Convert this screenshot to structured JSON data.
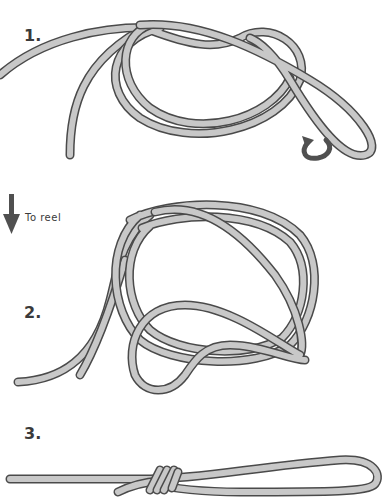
{
  "steps": [
    {
      "number": "1.",
      "label_top": 28
    },
    {
      "number": "2.",
      "label_top": 305
    },
    {
      "number": "3.",
      "label_top": 425
    }
  ],
  "annotations": {
    "reel_label": "To reel",
    "reel_arrow": "arrow-down-icon",
    "twist_arrow": "curved-arrow-icon"
  },
  "colors": {
    "rope_fill": "#c8c8c8",
    "rope_outline": "#4a4a4a",
    "text": "#3a3a3a",
    "arrow": "#505050",
    "background": "#ffffff"
  }
}
